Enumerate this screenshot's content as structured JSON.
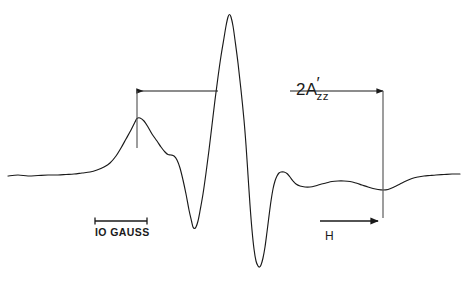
{
  "figure": {
    "kind": "esr-derivative-spectrum",
    "background_color": "#ffffff",
    "trace_color": "#1a1a1a",
    "annotation_color": "#1a1a1a",
    "width": 467,
    "height": 283
  },
  "annotations": {
    "scalebar_label": "IO GAUSS",
    "splitting_label_main": "2A",
    "splitting_label_prime": "′",
    "splitting_label_subscript": "zz",
    "field_axis_label": "H"
  },
  "chart_data": {
    "type": "line",
    "title": "",
    "subtitle": "",
    "xlabel": "H",
    "ylabel": "",
    "grid": false,
    "legend": false,
    "axis_visible": false,
    "xlim": [
      0,
      467
    ],
    "ylim": [
      283,
      0
    ],
    "series": [
      {
        "name": "ESR first-derivative spectrum",
        "color": "#1a1a1a",
        "points": [
          [
            8,
            176
          ],
          [
            18,
            175
          ],
          [
            28,
            176
          ],
          [
            38,
            175.5
          ],
          [
            48,
            175
          ],
          [
            58,
            175
          ],
          [
            66,
            174.5
          ],
          [
            74,
            174
          ],
          [
            82,
            173
          ],
          [
            90,
            172
          ],
          [
            97,
            170
          ],
          [
            104,
            167
          ],
          [
            110,
            163
          ],
          [
            116,
            156
          ],
          [
            121,
            148
          ],
          [
            126,
            139
          ],
          [
            131,
            130
          ],
          [
            135,
            122
          ],
          [
            137,
            118.5
          ],
          [
            140,
            118
          ],
          [
            144,
            121
          ],
          [
            148,
            127
          ],
          [
            152,
            134
          ],
          [
            157,
            141
          ],
          [
            161,
            147
          ],
          [
            165,
            152
          ],
          [
            168,
            154.5
          ],
          [
            171,
            155
          ],
          [
            174,
            156
          ],
          [
            177,
            160
          ],
          [
            180,
            168
          ],
          [
            183,
            180
          ],
          [
            186,
            194
          ],
          [
            189,
            210
          ],
          [
            191.5,
            221
          ],
          [
            193,
            227
          ],
          [
            194.5,
            228.5
          ],
          [
            196,
            227
          ],
          [
            198,
            221
          ],
          [
            200,
            211
          ],
          [
            203,
            194
          ],
          [
            206,
            173
          ],
          [
            209,
            150
          ],
          [
            212,
            125
          ],
          [
            215,
            100
          ],
          [
            218,
            77
          ],
          [
            221,
            56
          ],
          [
            224,
            38
          ],
          [
            226,
            26
          ],
          [
            228,
            17
          ],
          [
            229.5,
            14.5
          ],
          [
            231,
            17
          ],
          [
            233,
            26
          ],
          [
            235,
            40
          ],
          [
            238,
            63
          ],
          [
            241,
            90
          ],
          [
            244,
            120
          ],
          [
            246,
            145
          ],
          [
            248,
            175
          ],
          [
            250,
            205
          ],
          [
            252,
            230
          ],
          [
            254,
            249
          ],
          [
            256,
            261
          ],
          [
            258,
            266
          ],
          [
            259.5,
            267
          ],
          [
            261,
            265
          ],
          [
            263,
            258
          ],
          [
            265,
            247
          ],
          [
            267,
            232
          ],
          [
            269,
            216
          ],
          [
            271,
            201
          ],
          [
            273,
            189
          ],
          [
            275,
            181
          ],
          [
            277,
            176
          ],
          [
            279,
            173
          ],
          [
            281,
            172
          ],
          [
            284,
            172
          ],
          [
            287,
            173.5
          ],
          [
            290,
            177
          ],
          [
            293,
            181
          ],
          [
            296,
            184
          ],
          [
            300,
            186
          ],
          [
            305,
            187
          ],
          [
            310,
            187
          ],
          [
            315,
            186
          ],
          [
            320,
            184.5
          ],
          [
            326,
            183
          ],
          [
            332,
            181.5
          ],
          [
            338,
            181
          ],
          [
            344,
            181
          ],
          [
            350,
            181.5
          ],
          [
            356,
            183
          ],
          [
            362,
            185
          ],
          [
            368,
            187
          ],
          [
            373,
            188.5
          ],
          [
            378,
            189.5
          ],
          [
            383,
            190
          ],
          [
            388,
            189.5
          ],
          [
            394,
            187
          ],
          [
            400,
            184
          ],
          [
            406,
            181
          ],
          [
            412,
            178.5
          ],
          [
            418,
            177
          ],
          [
            424,
            176
          ],
          [
            430,
            175.5
          ],
          [
            436,
            175
          ],
          [
            444,
            174.5
          ],
          [
            452,
            174
          ],
          [
            460,
            174
          ]
        ]
      }
    ],
    "markers": {
      "splitting_arrow": {
        "label": "2A'zz",
        "y": 91,
        "x_start": 137,
        "x_end": 383,
        "left_tick_x": 137,
        "left_tick_y_top": 91,
        "left_tick_y_bottom": 148,
        "right_tick_x": 383,
        "right_tick_y_top": 91,
        "right_tick_y_bottom": 218
      },
      "scale_bar": {
        "label": "IO GAUSS",
        "y": 221,
        "x_start": 95,
        "x_end": 147
      },
      "field_arrow": {
        "label": "H",
        "y": 221,
        "x_start": 320,
        "x_end": 378
      }
    }
  }
}
